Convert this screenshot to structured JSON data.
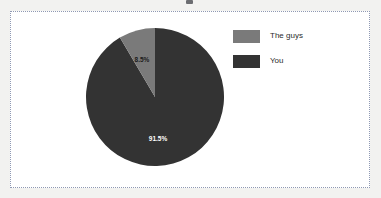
{
  "chart_data": {
    "type": "pie",
    "title": "",
    "categories": [
      "The guys",
      "You"
    ],
    "values": [
      8.5,
      91.5
    ],
    "labels": [
      "8.5%",
      "91.5%"
    ],
    "units": "percent",
    "colors": [
      "#7a7a7a",
      "#333333"
    ],
    "start_angle_deg": 90,
    "direction": "counterclockwise",
    "legend_position": "right",
    "grid": false,
    "slices": [
      {
        "name": "The guys",
        "value": 8.5,
        "label": "8.5%",
        "color": "#7a7a7a",
        "label_color": "#1a1a1a"
      },
      {
        "name": "You",
        "value": 91.5,
        "label": "91.5%",
        "color": "#333333",
        "label_color": "#ffffff"
      }
    ]
  },
  "legend": {
    "items": [
      {
        "label": "The guys",
        "swatch_color": "#7a7a7a",
        "swatch_name": "legend-swatch-the-guys"
      },
      {
        "label": "You",
        "swatch_color": "#333333",
        "swatch_name": "legend-swatch-you"
      }
    ]
  },
  "frame": {
    "border_color": "#8f99b3",
    "background": "#ffffff"
  },
  "page": {
    "background": "#f2f2f0"
  }
}
